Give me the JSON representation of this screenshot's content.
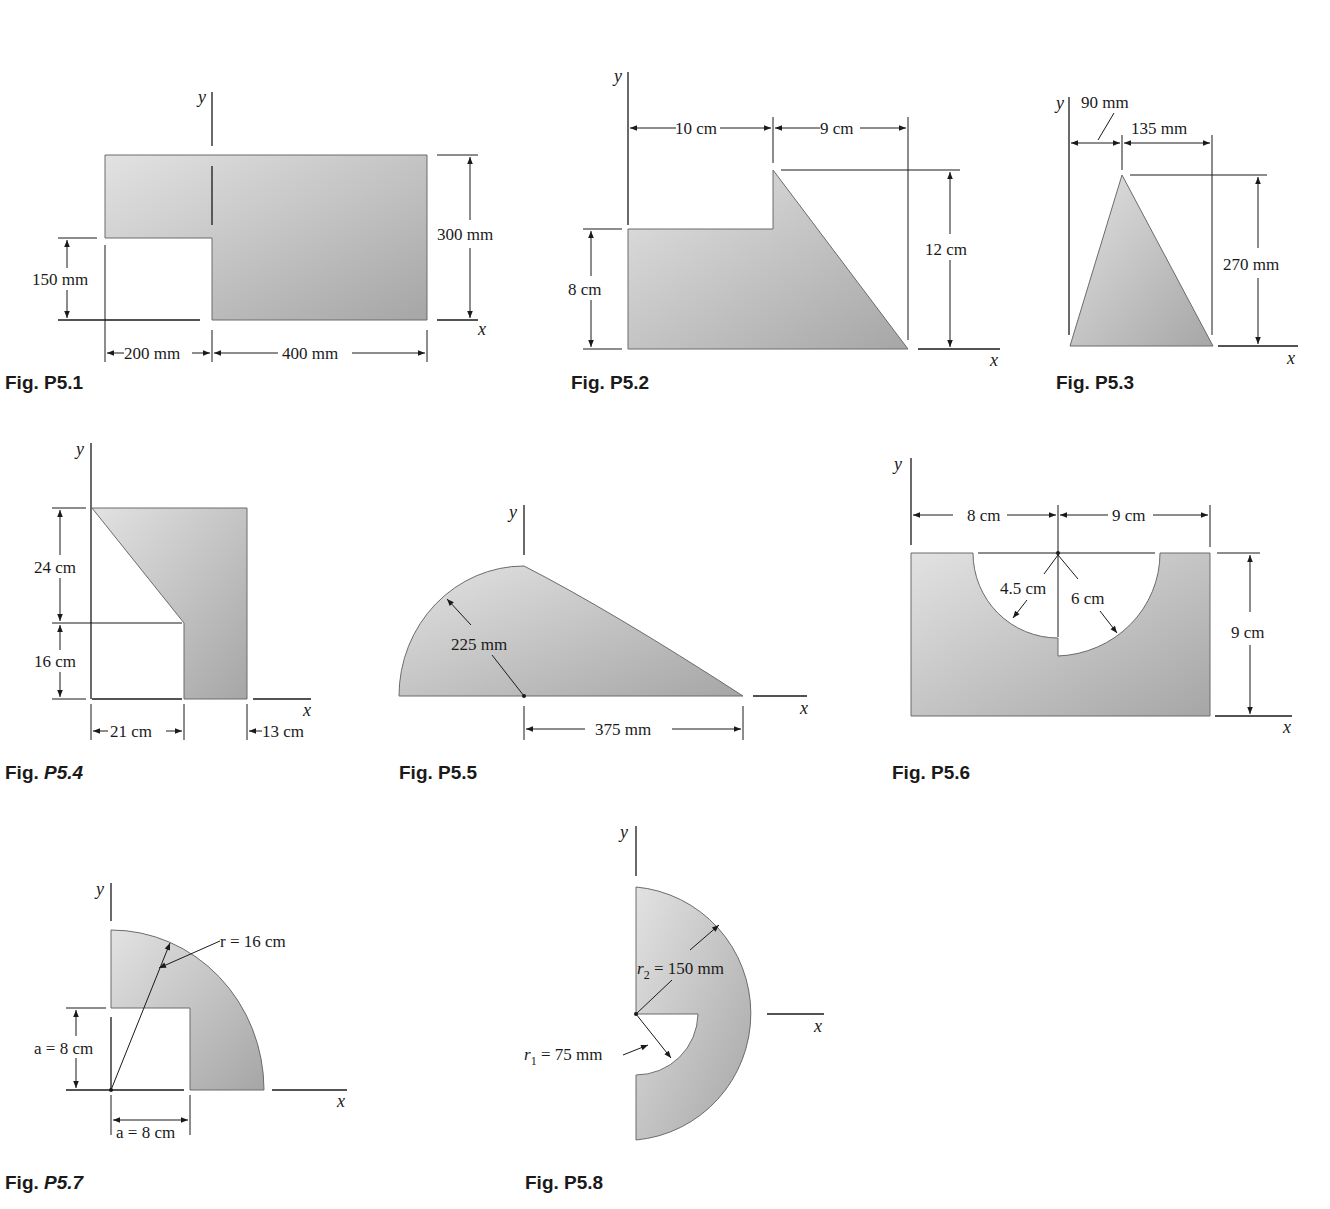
{
  "page": {
    "colors": {
      "shape_fill_light": "#d9d9d9",
      "shape_fill_dark": "#a9a9a9",
      "ink": "#1a1a1a",
      "background": "#ffffff"
    }
  },
  "axes": {
    "x_label": "x",
    "y_label": "y"
  },
  "figures": {
    "p5_1": {
      "caption_prefix": "Fig. ",
      "caption_num": "P5.1",
      "caption_italic": false,
      "dims": {
        "height_left": "150 mm",
        "height_right": "300 mm",
        "width_left": "200 mm",
        "width_right": "400 mm"
      }
    },
    "p5_2": {
      "caption_prefix": "Fig. ",
      "caption_num": "P5.2",
      "caption_italic": false,
      "dims": {
        "width_left": "10 cm",
        "width_right": "9 cm",
        "height_left": "8 cm",
        "height_total": "12 cm"
      }
    },
    "p5_3": {
      "caption_prefix": "Fig. ",
      "caption_num": "P5.3",
      "caption_italic": false,
      "dims": {
        "apex_offset": "90 mm",
        "width_right": "135 mm",
        "height": "270 mm"
      }
    },
    "p5_4": {
      "caption_prefix": "Fig. ",
      "caption_num": "P5.4",
      "caption_italic": true,
      "dims": {
        "height_top": "24 cm",
        "height_bottom": "16 cm",
        "width_left": "21 cm",
        "width_right": "13 cm"
      }
    },
    "p5_5": {
      "caption_prefix": "Fig. ",
      "caption_num": "P5.5",
      "caption_italic": false,
      "dims": {
        "radius": "225 mm",
        "base": "375 mm"
      }
    },
    "p5_6": {
      "caption_prefix": "Fig. ",
      "caption_num": "P5.6",
      "caption_italic": false,
      "dims": {
        "width_left": "8 cm",
        "width_right": "9 cm",
        "radius_small": "4.5 cm",
        "radius_large": "6 cm",
        "height": "9 cm"
      }
    },
    "p5_7": {
      "caption_prefix": "Fig. ",
      "caption_num": "P5.7",
      "caption_italic": true,
      "dims": {
        "radius": "r = 16 cm",
        "a_vertical": "a = 8 cm",
        "a_horizontal": "a = 8 cm"
      }
    },
    "p5_8": {
      "caption_prefix": "Fig. ",
      "caption_num": "P5.8",
      "caption_italic": false,
      "dims": {
        "r2": "r",
        "r2_sub": "2",
        "r2_value": " = 150 mm",
        "r1": "r",
        "r1_sub": "1",
        "r1_value": " = 75 mm"
      }
    }
  }
}
